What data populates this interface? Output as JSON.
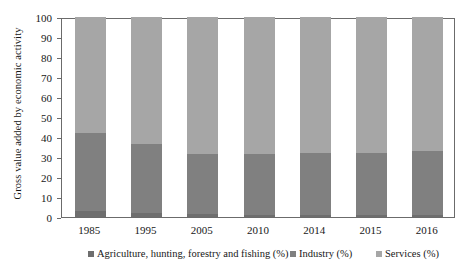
{
  "chart_data": {
    "type": "bar",
    "subtype": "stacked-bar-100",
    "title": "",
    "xlabel": "",
    "ylabel": "Gross value added by economic activity",
    "ylim": [
      0,
      100
    ],
    "yticks": [
      0,
      10,
      20,
      30,
      40,
      50,
      60,
      70,
      80,
      90,
      100
    ],
    "grid": false,
    "legend_position": "bottom",
    "categories": [
      "1985",
      "1995",
      "2005",
      "2010",
      "2014",
      "2015",
      "2016"
    ],
    "series": [
      {
        "name": "Agriculture, hunting, forestry and fishing (%)",
        "color": "#6e6e6e",
        "values": [
          3,
          2,
          1.5,
          1,
          1,
          1,
          1
        ]
      },
      {
        "name": "Industry (%)",
        "color": "#808080",
        "values": [
          39,
          34.5,
          30,
          30.5,
          31,
          31,
          32
        ]
      },
      {
        "name": "Services (%)",
        "color": "#a6a6a6",
        "values": [
          58,
          63.5,
          68.5,
          68.5,
          68,
          68,
          67
        ]
      }
    ]
  },
  "axis": {
    "y_title": "Gross value added by economic activity"
  }
}
